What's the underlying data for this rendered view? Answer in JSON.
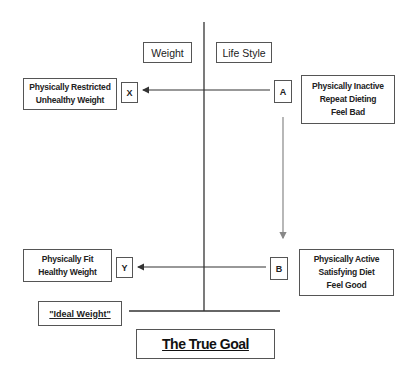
{
  "headers": {
    "left": "Weight",
    "right": "Life Style"
  },
  "top_row": {
    "weight_state": [
      "Physically Restricted",
      "Unhealthy Weight"
    ],
    "weight_label": "X",
    "lifestyle_label": "A",
    "lifestyle_state": [
      "Physically Inactive",
      "Repeat Dieting",
      "Feel Bad"
    ]
  },
  "bottom_row": {
    "weight_state": [
      "Physically Fit",
      "Healthy Weight"
    ],
    "weight_label": "Y",
    "lifestyle_label": "B",
    "lifestyle_state": [
      "Physically Active",
      "Satisfying Diet",
      "Feel Good"
    ]
  },
  "ideal_weight": "\"Ideal Weight\"",
  "goal": "The True Goal",
  "colors": {
    "line": "#333333",
    "arrow_down": "#888888",
    "border": "#555555"
  }
}
